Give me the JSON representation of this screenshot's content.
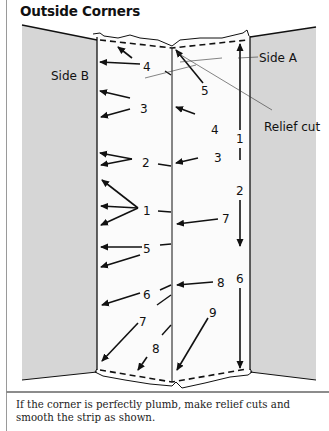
{
  "title": "Outside Corners",
  "labels": {
    "side_a": "Side A",
    "side_b": "Side B",
    "relief_cut": "Relief cut"
  },
  "numbers": {
    "left": [
      "4",
      "3",
      "2",
      "1",
      "5",
      "6",
      "7",
      "8"
    ],
    "right": [
      "5",
      "4",
      "3",
      "7",
      "8",
      "9"
    ],
    "vertical": [
      "1",
      "2",
      "6"
    ]
  },
  "caption": "If the corner is perfectly plumb, make relief cuts and smooth the strip as shown.",
  "colors": {
    "wall_grey": "#d4d4d4",
    "line": "#111111",
    "divider": "#8c8c8c"
  }
}
